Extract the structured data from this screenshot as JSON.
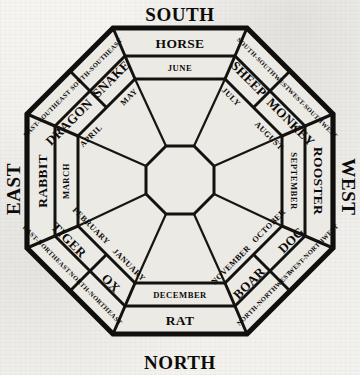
{
  "diagram": {
    "colors": {
      "ink": "#0c0b09",
      "paper": "#f4f3f0",
      "cell": "#eceae5"
    },
    "cardinals": [
      {
        "label": "SOUTH",
        "position": "top"
      },
      {
        "label": "EAST",
        "position": "left"
      },
      {
        "label": "WEST",
        "position": "right"
      },
      {
        "label": "NORTH",
        "position": "bottom"
      }
    ],
    "intercardinals": [
      {
        "label": "EAST-SOUTHEAST",
        "position": "upper-left-outer"
      },
      {
        "label": "SOUTH-SOUTHEAST",
        "position": "upper-left-inner"
      },
      {
        "label": "SOUTH-SOUTHWEST",
        "position": "upper-right-inner"
      },
      {
        "label": "WEST-SOUTHWEST",
        "position": "upper-right-outer"
      },
      {
        "label": "WEST-NORTHWEST",
        "position": "lower-right-outer"
      },
      {
        "label": "NORTH-NORTHWEST",
        "position": "lower-right-inner"
      },
      {
        "label": "NORTH-NORTHEAST",
        "position": "lower-left-inner"
      },
      {
        "label": "EAST-NORTHEAST",
        "position": "lower-left-outer"
      }
    ],
    "sectors": [
      {
        "animal": "HORSE",
        "month": "JUNE",
        "direction": "SOUTH",
        "side": "top"
      },
      {
        "animal": "SHEEP",
        "month": "JULY",
        "direction": "SOUTH-SOUTHWEST",
        "side": "upper-right"
      },
      {
        "animal": "MONKEY",
        "month": "AUGUST",
        "direction": "WEST-SOUTHWEST",
        "side": "upper-right"
      },
      {
        "animal": "ROOSTER",
        "month": "SEPTEMBER",
        "direction": "WEST",
        "side": "right"
      },
      {
        "animal": "DOG",
        "month": "OCTOBER",
        "direction": "WEST-NORTHWEST",
        "side": "lower-right"
      },
      {
        "animal": "BOAR",
        "month": "NOVEMBER",
        "direction": "NORTH-NORTHWEST",
        "side": "lower-right"
      },
      {
        "animal": "RAT",
        "month": "DECEMBER",
        "direction": "NORTH",
        "side": "bottom"
      },
      {
        "animal": "OX",
        "month": "JANUARY",
        "direction": "NORTH-NORTHEAST",
        "side": "lower-left"
      },
      {
        "animal": "TIGER",
        "month": "FEBRUARY",
        "direction": "EAST-NORTHEAST",
        "side": "lower-left"
      },
      {
        "animal": "RABBIT",
        "month": "MARCH",
        "direction": "EAST",
        "side": "left"
      },
      {
        "animal": "DRAGON",
        "month": "APRIL",
        "direction": "EAST-SOUTHEAST",
        "side": "upper-left"
      },
      {
        "animal": "SNAKE",
        "month": "MAY",
        "direction": "SOUTH-SOUTHEAST",
        "side": "upper-left"
      }
    ],
    "center": {
      "shape": "octagon",
      "label": ""
    }
  }
}
